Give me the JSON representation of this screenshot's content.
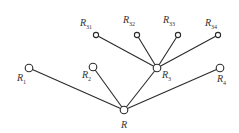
{
  "diagram": {
    "type": "tree",
    "root": "R",
    "nodes": [
      {
        "id": "R",
        "base": "R",
        "sub": "",
        "x": 124,
        "y": 110,
        "r": 3.8,
        "lx": 121,
        "ly": 128
      },
      {
        "id": "R1",
        "base": "R",
        "sub": "1",
        "x": 29,
        "y": 68,
        "r": 3.8,
        "lx": 17,
        "ly": 81
      },
      {
        "id": "R2",
        "base": "R",
        "sub": "2",
        "x": 93,
        "y": 67,
        "r": 3.8,
        "lx": 82,
        "ly": 78
      },
      {
        "id": "R3",
        "base": "R",
        "sub": "3",
        "x": 157,
        "y": 68,
        "r": 3.8,
        "lx": 162,
        "ly": 78
      },
      {
        "id": "R4",
        "base": "R",
        "sub": "4",
        "x": 220,
        "y": 68,
        "r": 3.8,
        "lx": 217,
        "ly": 82
      },
      {
        "id": "R31",
        "base": "R",
        "sub": "31",
        "x": 96,
        "y": 35,
        "r": 2.6,
        "lx": 80,
        "ly": 26
      },
      {
        "id": "R32",
        "base": "R",
        "sub": "32",
        "x": 137,
        "y": 35,
        "r": 2.6,
        "lx": 123,
        "ly": 23
      },
      {
        "id": "R33",
        "base": "R",
        "sub": "33",
        "x": 178,
        "y": 35,
        "r": 2.6,
        "lx": 163,
        "ly": 23
      },
      {
        "id": "R34",
        "base": "R",
        "sub": "34",
        "x": 218,
        "y": 35,
        "r": 2.6,
        "lx": 205,
        "ly": 26
      }
    ],
    "edges": [
      [
        "R",
        "R1"
      ],
      [
        "R",
        "R2"
      ],
      [
        "R",
        "R3"
      ],
      [
        "R",
        "R4"
      ],
      [
        "R3",
        "R31"
      ],
      [
        "R3",
        "R32"
      ],
      [
        "R3",
        "R33"
      ],
      [
        "R3",
        "R34"
      ]
    ]
  },
  "labels": {
    "R": {
      "base": "R",
      "sub": ""
    },
    "R1": {
      "base": "R",
      "sub": "1"
    },
    "R2": {
      "base": "R",
      "sub": "2"
    },
    "R3": {
      "base": "R",
      "sub": "3"
    },
    "R4": {
      "base": "R",
      "sub": "4"
    },
    "R31": {
      "base": "R",
      "sub": "31"
    },
    "R32": {
      "base": "R",
      "sub": "32"
    },
    "R33": {
      "base": "R",
      "sub": "33"
    },
    "R34": {
      "base": "R",
      "sub": "34"
    }
  }
}
